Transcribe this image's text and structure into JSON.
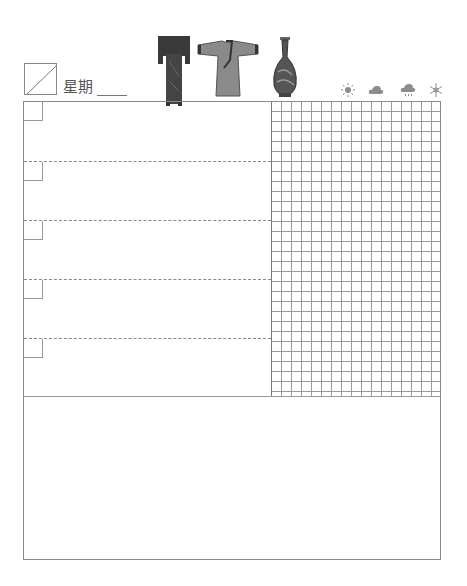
{
  "header": {
    "date_box_label": "",
    "weekday_label": "星期",
    "weekday_value": ""
  },
  "illustrations": [
    {
      "name": "robe-stand",
      "description": "dark hanging garment stand"
    },
    {
      "name": "robe",
      "description": "traditional Chinese robe (hanfu)"
    },
    {
      "name": "vase",
      "description": "blue and white porcelain vase"
    }
  ],
  "weather": {
    "options": [
      {
        "name": "sunny",
        "icon": "sun-icon"
      },
      {
        "name": "cloudy",
        "icon": "cloud-icon"
      },
      {
        "name": "rain",
        "icon": "rain-cloud-icon"
      },
      {
        "name": "snow",
        "icon": "snowflake-icon"
      }
    ]
  },
  "todo": {
    "rows": [
      {
        "checked": false,
        "text": ""
      },
      {
        "checked": false,
        "text": ""
      },
      {
        "checked": false,
        "text": ""
      },
      {
        "checked": false,
        "text": ""
      },
      {
        "checked": false,
        "text": ""
      }
    ]
  },
  "grid": {
    "columns": 17,
    "rows": 29
  },
  "notes": {
    "text": ""
  },
  "colors": {
    "line": "#8a8a8a",
    "grid": "#9a9a9a",
    "text": "#555555",
    "icon": "#8c8c8c"
  }
}
